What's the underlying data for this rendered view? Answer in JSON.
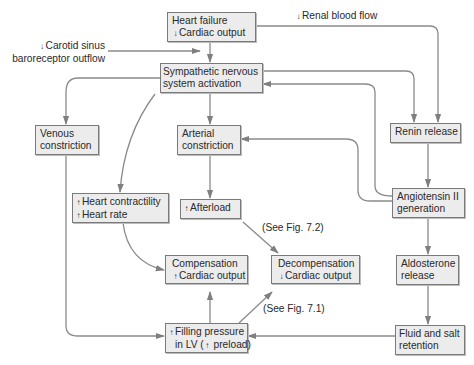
{
  "diagram": {
    "colors": {
      "box_fill": "#ececec",
      "box_border": "#7a7a7a",
      "edge": "#7f7f7f",
      "text": "#2a2a2a"
    },
    "nodes": {
      "heart_failure": {
        "line1": "Heart failure",
        "arrow": "↓",
        "line2": "Cardiac output"
      },
      "sympathetic": {
        "line1": "Sympathetic nervous",
        "line2": "system activation"
      },
      "venous": {
        "line1": "Venous",
        "line2": "constriction"
      },
      "arterial": {
        "line1": "Arterial",
        "line2": "constriction"
      },
      "renin": {
        "line1": "Renin release"
      },
      "contractility": {
        "arrow1": "↑",
        "line1": "Heart contractility",
        "arrow2": "↑",
        "line2": "Heart rate"
      },
      "afterload": {
        "arrow": "↑",
        "line1": "Afterload"
      },
      "angiotensin": {
        "line1": "Angiotensin II",
        "line2": "generation"
      },
      "compensation": {
        "line1": "Compensation",
        "arrow": "↑",
        "line2": "Cardiac output"
      },
      "decompensation": {
        "line1": "Decompensation",
        "arrow": "↓",
        "line2": "Cardiac output"
      },
      "aldosterone": {
        "line1": "Aldosterone",
        "line2": "release"
      },
      "filling": {
        "arrow1": "↑",
        "line1": "Filling pressure",
        "line2a": "in LV (",
        "arrow2": "↑",
        "line2b": " preload)"
      },
      "fluid": {
        "line1": "Fluid and salt",
        "line2": "retention"
      }
    },
    "labels": {
      "carotid": {
        "arrow": "↓",
        "line1": "Carotid sinus",
        "line2": "baroreceptor outflow"
      },
      "renal": {
        "arrow": "↓",
        "text": "Renal blood flow"
      },
      "see_fig_72": "(See Fig. 7.2)",
      "see_fig_71": "(See Fig. 7.1)"
    }
  }
}
